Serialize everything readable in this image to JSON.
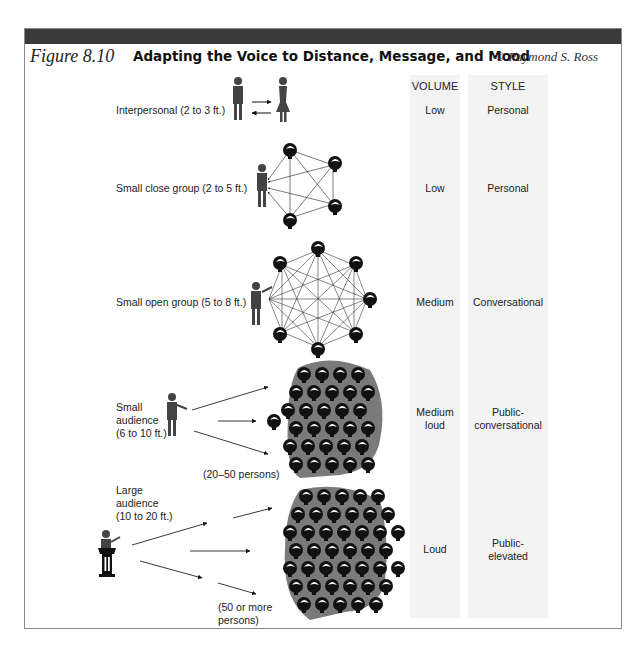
{
  "figure": {
    "number": "Figure 8.10",
    "title": "Adapting the Voice to Distance, Message, and Mood",
    "credit": "© Raymond S. Ross"
  },
  "columns": {
    "volume_header": "VOLUME",
    "style_header": "STYLE"
  },
  "rows": [
    {
      "label": "Interpersonal (2 to 3 ft.)",
      "volume": "Low",
      "style": "Personal"
    },
    {
      "label": "Small close group (2 to 5 ft.)",
      "volume": "Low",
      "style": "Personal"
    },
    {
      "label": "Small open group (5 to 8 ft.)",
      "volume": "Medium",
      "style": "Conversational"
    },
    {
      "label_lines": [
        "Small",
        "audience",
        "(6 to 10 ft.)"
      ],
      "volume_lines": [
        "Medium",
        "loud"
      ],
      "style_lines": [
        "Public-",
        "conversational"
      ],
      "note": "(20–50 persons)"
    },
    {
      "label_lines": [
        "Large",
        "audience",
        "(10 to 20 ft.)"
      ],
      "volume": "Loud",
      "style_lines": [
        "Public-",
        "elevated"
      ],
      "note_lines": [
        "(50 or more",
        "persons)"
      ]
    }
  ],
  "colors": {
    "figure_bar": "#3a3a3a",
    "column_shade": "#f3f3f3",
    "crowd_backdrop": "#7a7a7a",
    "head": "#111111"
  }
}
